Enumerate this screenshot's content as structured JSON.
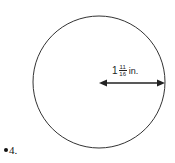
{
  "diagram": {
    "shape": "circle",
    "measurement": "radius",
    "label": {
      "whole": "1",
      "numerator": "11",
      "denominator": "16",
      "unit": "in."
    },
    "stroke_color": "#333333"
  },
  "question": {
    "number": "4."
  }
}
